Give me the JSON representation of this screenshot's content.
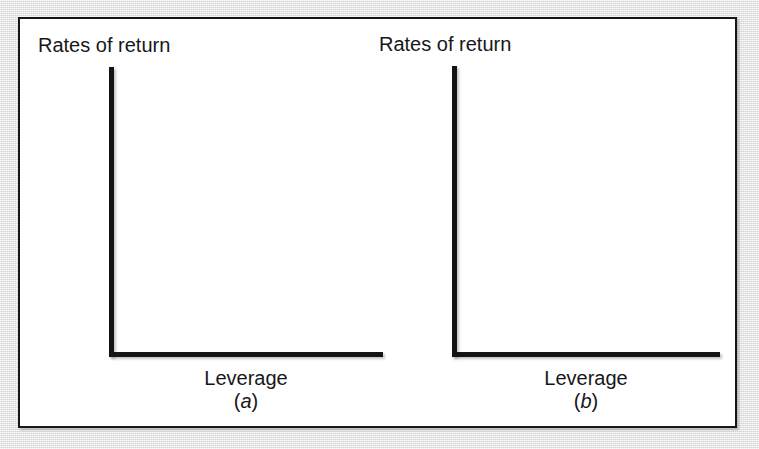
{
  "figure": {
    "background_color": "#e9e9e9",
    "paper_color": "#ffffff",
    "ink_color": "#17171a",
    "border_color": "#17171a"
  },
  "chart_data": [
    {
      "type": "line",
      "title": "",
      "panel_label": "(a)",
      "panel_letter": "a",
      "xlabel": "Leverage",
      "ylabel": "Rates of return",
      "grid": false,
      "legend": "none",
      "axis_style": "bare-L-axes-no-ticks",
      "tick_labels_x": [],
      "tick_labels_y": [],
      "series": [],
      "annotations": [],
      "note": "Empty axes template: vertical axis labelled Rates of return, horizontal axis labelled Leverage; no data curves drawn."
    },
    {
      "type": "line",
      "title": "",
      "panel_label": "(b)",
      "panel_letter": "b",
      "xlabel": "Leverage",
      "ylabel": "Rates of return",
      "grid": false,
      "legend": "none",
      "axis_style": "bare-L-axes-no-ticks",
      "tick_labels_x": [],
      "tick_labels_y": [],
      "series": [],
      "annotations": [],
      "note": "Empty axes template: vertical axis labelled Rates of return, horizontal axis labelled Leverage; no data curves drawn."
    }
  ],
  "panels": [
    {
      "id": "a",
      "ylabel": "Rates of return",
      "xlabel": "Leverage",
      "caption_open": "(",
      "caption_letter": "a",
      "caption_close": ")"
    },
    {
      "id": "b",
      "ylabel": "Rates of return",
      "xlabel": "Leverage",
      "caption_open": "(",
      "caption_letter": "b",
      "caption_close": ")"
    }
  ]
}
